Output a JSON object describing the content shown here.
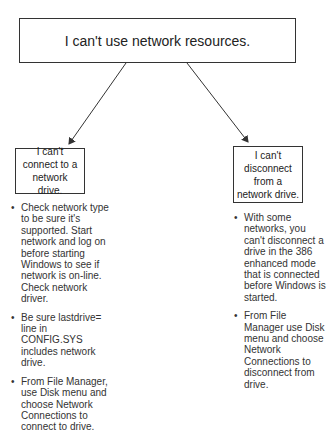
{
  "diagram": {
    "root": {
      "label": "I can't use network resources."
    },
    "branches": [
      {
        "label": "I can't connect to a network drive.",
        "tips": [
          "Check network type to be sure it's supported. Start network and log on before starting Windows to see if network is on-line. Check network driver.",
          "Be sure lastdrive= line in CONFIG.SYS includes network drive.",
          "From File Manager, use Disk menu and choose Network Connections to connect to drive."
        ]
      },
      {
        "label": "I can't disconnect from a network drive.",
        "tips": [
          "With some networks, you can't disconnect a drive in the 386 enhanced mode that is connected before Windows is started.",
          "From File Manager use Disk menu and choose Network Connections to disconnect from drive."
        ]
      }
    ],
    "bullet_glyph": "•",
    "colors": {
      "line": "#333333",
      "text": "#222222",
      "background": "#ffffff"
    }
  }
}
